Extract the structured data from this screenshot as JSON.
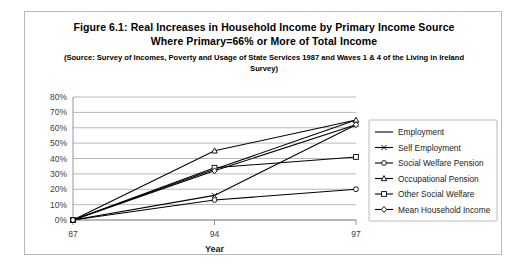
{
  "figure": {
    "title_line_1": "Figure 6.1: Real Increases in Household Income by Primary Income Source",
    "title_line_2": "Where Primary=66% or More of Total Income",
    "source_note": "(Source: Survey of Incomes, Poverty and Usage of State Services 1987 and Waves 1 & 4 of the Living in Ireland Survey)"
  },
  "chart_data": {
    "type": "line",
    "title": "Figure 6.1: Real Increases in Household Income by Primary Income Source Where Primary=66% or More of Total Income",
    "xlabel": "Year",
    "ylabel": "",
    "categories": [
      "87",
      "94",
      "97"
    ],
    "ylim": [
      0,
      80
    ],
    "ytick_labels": [
      "0%",
      "10%",
      "20%",
      "30%",
      "40%",
      "50%",
      "60%",
      "70%",
      "80%"
    ],
    "ytick_values": [
      0,
      10,
      20,
      30,
      40,
      50,
      60,
      70,
      80
    ],
    "grid": true,
    "legend_position": "right",
    "series": [
      {
        "name": "Employment",
        "marker": "none",
        "values": [
          0,
          33,
          65
        ]
      },
      {
        "name": "Self Employment",
        "marker": "cross",
        "values": [
          0,
          16,
          62
        ]
      },
      {
        "name": "Social Welfare Pension",
        "marker": "circle",
        "values": [
          0,
          13,
          20
        ]
      },
      {
        "name": "Occupational Pension",
        "marker": "triangle",
        "values": [
          0,
          45,
          65
        ]
      },
      {
        "name": "Other Social Welfare",
        "marker": "square",
        "values": [
          0,
          34,
          41
        ]
      },
      {
        "name": "Mean Household Income",
        "marker": "diamond",
        "values": [
          0,
          32,
          62
        ]
      }
    ]
  },
  "axes": {
    "x_title": "Year",
    "x_tick_labels": [
      "87",
      "94",
      "97"
    ],
    "y_tick_labels": [
      "80%",
      "70%",
      "60%",
      "50%",
      "40%",
      "30%",
      "20%",
      "10%",
      "0%"
    ]
  },
  "legend": {
    "items": [
      {
        "label": "Employment",
        "marker": "none"
      },
      {
        "label": "Self Employment",
        "marker": "cross"
      },
      {
        "label": "Social Welfare Pension",
        "marker": "circle"
      },
      {
        "label": "Occupational Pension",
        "marker": "triangle"
      },
      {
        "label": "Other Social Welfare",
        "marker": "square"
      },
      {
        "label": "Mean Household Income",
        "marker": "diamond"
      }
    ]
  },
  "colors": {
    "line": "#000000",
    "grid": "#9a9a9a",
    "frame": "#b9b9b9",
    "background": "#ffffff"
  }
}
